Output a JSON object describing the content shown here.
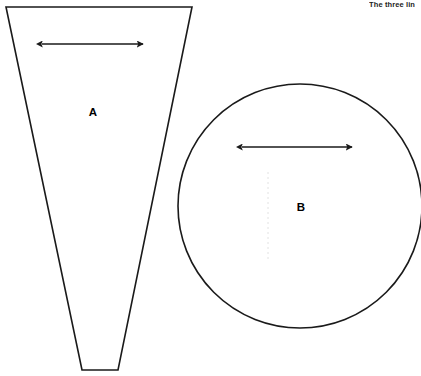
{
  "figure": {
    "background_color": "#ffffff",
    "stroke_color": "#1a1a1a",
    "caption_fragment": "The three lin",
    "shapes": [
      {
        "id": "A",
        "label": "A",
        "kind": "truncated-triangle",
        "label_x": 93,
        "label_y": 113,
        "points": "6,7 192,7 118,370 82,370"
      },
      {
        "id": "B",
        "label": "B",
        "kind": "circle",
        "label_x": 301,
        "label_y": 208,
        "cx": 300,
        "cy": 206,
        "r": 122
      }
    ],
    "arrows": [
      {
        "id": "arrow-a",
        "belongs_to": "A",
        "x1": 42,
        "x2": 143,
        "y": 44
      },
      {
        "id": "arrow-b",
        "belongs_to": "B",
        "x1": 242,
        "x2": 352,
        "y": 147
      }
    ]
  }
}
